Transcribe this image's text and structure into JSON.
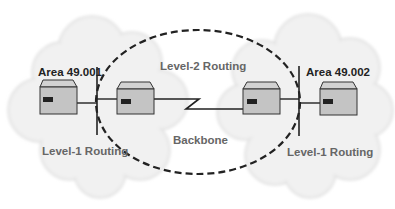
{
  "diagram": {
    "labels": {
      "area_left": "Area 49.001",
      "area_right": "Area 49.002",
      "level2": "Level-2 Routing",
      "backbone": "Backbone",
      "level1_left": "Level-1 Routing",
      "level1_right": "Level-1 Routing"
    },
    "nodes": [
      {
        "id": "router-area1-l1",
        "area": "Area 49.001",
        "type": "router"
      },
      {
        "id": "router-area1-l2",
        "area": "Backbone",
        "type": "router"
      },
      {
        "id": "router-area2-l2",
        "area": "Backbone",
        "type": "router"
      },
      {
        "id": "router-area2-l1",
        "area": "Area 49.002",
        "type": "router"
      }
    ],
    "links": [
      {
        "from": "router-area1-l1",
        "to": "router-area1-l2",
        "type": "lan"
      },
      {
        "from": "router-area1-l2",
        "to": "router-area2-l2",
        "type": "serial"
      },
      {
        "from": "router-area2-l2",
        "to": "router-area2-l1",
        "type": "lan"
      }
    ],
    "colors": {
      "cloud": "#efefef",
      "cloud_edge": "#e2e2e2",
      "router_body": "#c4c4c4",
      "router_top": "#d2d2d2",
      "router_stroke": "#333333",
      "line": "#222222",
      "label_dark": "#222222",
      "label_gray": "#666666"
    }
  }
}
